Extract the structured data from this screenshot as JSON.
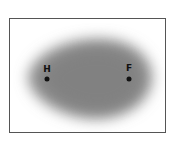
{
  "diagram": {
    "atoms": [
      {
        "symbol": "H",
        "label_x": 37,
        "label_y": 46,
        "dot_x": 37,
        "dot_y": 60
      },
      {
        "symbol": "F",
        "label_x": 119,
        "label_y": 45,
        "dot_x": 119,
        "dot_y": 60
      }
    ],
    "cloud_color": "#8a8a8a",
    "frame_color": "#555555"
  }
}
